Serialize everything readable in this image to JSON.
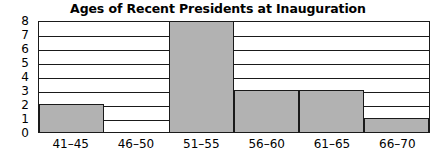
{
  "chart_data": {
    "type": "bar",
    "title": "Ages of Recent Presidents at Inauguration",
    "xlabel": "",
    "ylabel": "",
    "categories": [
      "41–45",
      "46–50",
      "51–55",
      "56–60",
      "61–65",
      "66–70"
    ],
    "values": [
      2,
      0,
      8,
      3,
      3,
      1
    ],
    "ylim": [
      0,
      8
    ],
    "yticks": [
      0,
      1,
      2,
      3,
      4,
      5,
      6,
      7,
      8
    ],
    "ytick_labels": [
      "0",
      "1",
      "2",
      "3",
      "4",
      "5",
      "6",
      "7",
      "8"
    ],
    "grid": "horizontal",
    "legend": "none",
    "bar_fill_color": "#b2b2b2",
    "bar_edge_color": "#1a1a1a",
    "background_color": "#ffffff",
    "text_color": "#000000"
  }
}
